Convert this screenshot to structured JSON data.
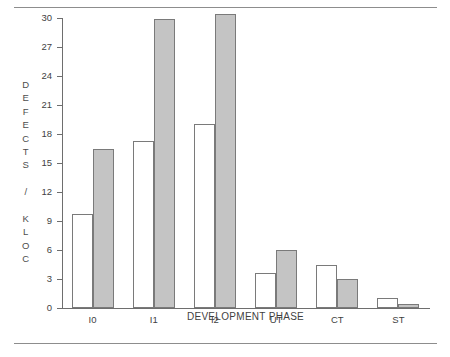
{
  "chart_data": {
    "type": "bar",
    "title": "",
    "xlabel": "DEVELOPMENT PHASE",
    "ylabel": "DEFECTS / KLOC",
    "categories": [
      "I0",
      "I1",
      "I2",
      "UT",
      "CT",
      "ST"
    ],
    "series": [
      {
        "name": "light",
        "values": [
          9.7,
          17.3,
          19.0,
          3.6,
          4.5,
          1.0
        ]
      },
      {
        "name": "dark",
        "values": [
          16.5,
          29.9,
          30.4,
          6.0,
          3.0,
          0.4
        ]
      }
    ],
    "ylim": [
      0,
      30
    ],
    "ytick_labels": [
      "0",
      "3",
      "6",
      "9",
      "12",
      "15",
      "18",
      "21",
      "24",
      "27",
      "30"
    ],
    "ytick_values": [
      0,
      3,
      6,
      9,
      12,
      15,
      18,
      21,
      24,
      27,
      30
    ],
    "grid": false,
    "legend": "none",
    "colors": {
      "light_fill": "#ffffff",
      "dark_fill": "#c4c4c4",
      "bar_stroke": "#7a7a7a",
      "axis": "#6e6e6e",
      "text": "#3f3f3f",
      "rule": "#8d8d8d"
    }
  },
  "ylabel_stacked": "D\nE\nF\nE\nC\nT\nS\n\n/\n\nK\nL\nO\nC"
}
